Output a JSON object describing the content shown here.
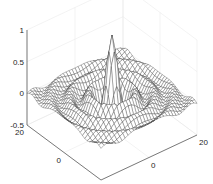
{
  "chart_data": {
    "type": "surface-mesh",
    "title": "",
    "xlabel": "",
    "ylabel": "",
    "zlabel": "",
    "function": "z = sin(r)/r, r = sqrt(x^2 + y^2)",
    "xlim": [
      -20,
      20
    ],
    "ylim": [
      -20,
      20
    ],
    "zlim": [
      -0.5,
      1
    ],
    "grid_step": 1.25,
    "mesh_color": "#3a3a3a",
    "face_color": "#ffffff",
    "grid": true,
    "x_ticks": [
      {
        "value": -20,
        "label": "-20"
      },
      {
        "value": 0,
        "label": "0"
      },
      {
        "value": 20,
        "label": "20"
      }
    ],
    "y_ticks": [
      {
        "value": 20,
        "label": "20"
      },
      {
        "value": 0,
        "label": "0"
      },
      {
        "value": -20,
        "label": "-20"
      }
    ],
    "z_ticks": [
      {
        "value": 1,
        "label": "1"
      },
      {
        "value": 0.5,
        "label": "0.5"
      },
      {
        "value": 0,
        "label": "0"
      },
      {
        "value": -0.5,
        "label": "-0.5"
      }
    ],
    "peak": {
      "x": 0,
      "y": 0,
      "z": 1
    }
  },
  "projection": {
    "origin_px": [
      101,
      180
    ],
    "x_unit_px": [
      2.4,
      -1.125
    ],
    "y_unit_px": [
      -1.85,
      -1.375
    ],
    "z_unit_px": [
      0,
      -63.33
    ],
    "z_floor": -0.5
  }
}
